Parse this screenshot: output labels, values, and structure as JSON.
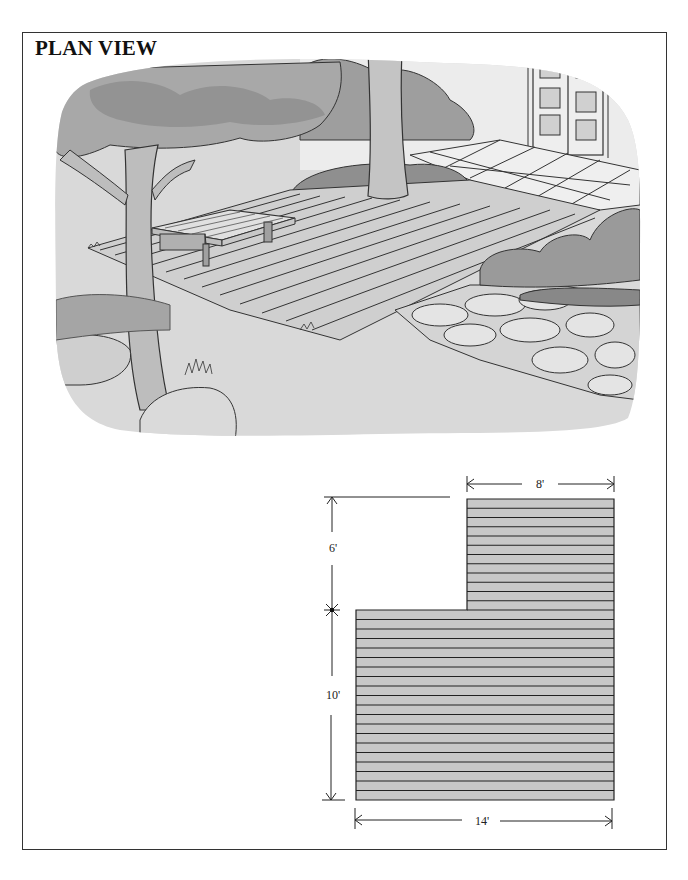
{
  "title": "PLAN VIEW",
  "illustration": {
    "description": "Perspective drawing of an L-shaped wood deck with a bench, tree, shrubs, patio tiles, stone path and french doors",
    "elements": [
      "tree",
      "tree-canopy",
      "bench",
      "deck-boards",
      "patio-tiles",
      "french-doors",
      "shrubs",
      "stone-path",
      "boulders",
      "grass",
      "lawn"
    ]
  },
  "plan": {
    "units": "feet",
    "board_color": "#c8c8c8",
    "line_color": "#222222",
    "upper_section": {
      "width_ft": 8,
      "depth_ft": 6,
      "boards": 12
    },
    "lower_section": {
      "width_ft": 14,
      "depth_ft": 10,
      "boards": 20
    },
    "dimensions": {
      "top_width": "8'",
      "upper_height": "6'",
      "lower_height": "10'",
      "bottom_width": "14'"
    }
  }
}
